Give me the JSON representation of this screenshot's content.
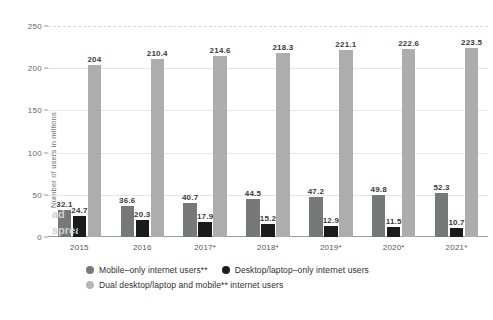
{
  "chart_data": {
    "type": "bar",
    "title": "",
    "subtitle": "",
    "xlabel": "",
    "ylabel": "Number of users in millions",
    "ylim": [
      0,
      250
    ],
    "yticks": [
      0,
      50,
      100,
      150,
      200,
      250
    ],
    "ytick_labels": [
      "0",
      "50",
      "100",
      "150",
      "200",
      "250"
    ],
    "grid": true,
    "legend_position": "bottom",
    "categories": [
      "2015",
      "2016",
      "2017*",
      "2018*",
      "2019*",
      "2020*",
      "2021*"
    ],
    "series": [
      {
        "name": "Mobile-only internet users**",
        "color": "#777879",
        "values": [
          32.1,
          36.6,
          40.7,
          44.5,
          47.2,
          49.8,
          52.3
        ],
        "labels": [
          "32.1",
          "36.6",
          "40.7",
          "44.5",
          "47.2",
          "49.8",
          "52.3"
        ]
      },
      {
        "name": "Desktop/laptop-only internet users",
        "color": "#1b1b1b",
        "values": [
          24.7,
          20.3,
          17.9,
          15.2,
          12.9,
          11.5,
          10.7
        ],
        "labels": [
          "24.7",
          "20.3",
          "17.9",
          "15.2",
          "12.9",
          "11.5",
          "10.7"
        ]
      },
      {
        "name": "Dual desktop/laptop and mobile** internet users",
        "color": "#adadad",
        "values": [
          204,
          210.4,
          214.6,
          218.3,
          221.1,
          222.6,
          223.5
        ],
        "labels": [
          "204",
          "210.4",
          "214.6",
          "218.3",
          "221.1",
          "222.6",
          "223.5"
        ]
      }
    ]
  },
  "legend": {
    "row1": [
      {
        "label": "Mobile–only internet users**",
        "swatch": "series-mobile"
      },
      {
        "label": "Desktop/laptop–only internet users",
        "swatch": "series-desktop"
      }
    ],
    "row2": [
      {
        "label": "Dual desktop/laptop and mobile** internet users",
        "swatch": "series-dual"
      }
    ]
  },
  "watermark": {
    "line1": "ad",
    "line2": "sprea"
  }
}
